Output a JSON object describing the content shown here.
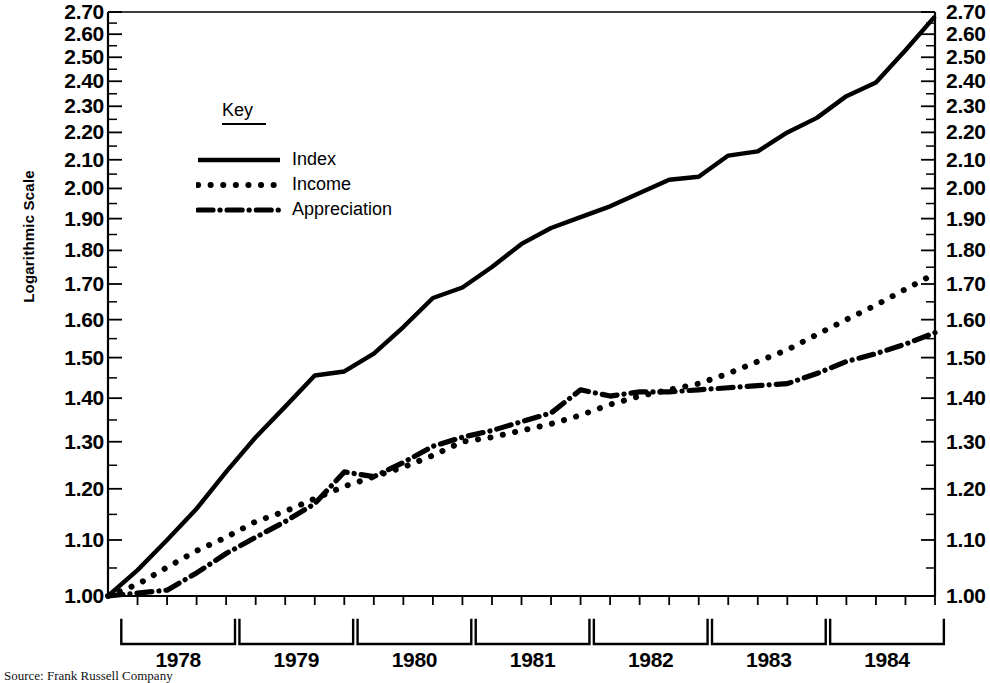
{
  "axis": {
    "y_title": "Logarithmic Scale",
    "y_ticks": [
      "1.00",
      "1.10",
      "1.20",
      "1.30",
      "1.40",
      "1.50",
      "1.60",
      "1.70",
      "1.80",
      "1.90",
      "2.00",
      "2.10",
      "2.20",
      "2.30",
      "2.40",
      "2.50",
      "2.60",
      "2.70"
    ],
    "x_ticks": [
      "1978",
      "1979",
      "1980",
      "1981",
      "1982",
      "1983",
      "1984"
    ]
  },
  "legend": {
    "title": "Key",
    "items": [
      {
        "label": "Index",
        "style": "solid"
      },
      {
        "label": "Income",
        "style": "dotted"
      },
      {
        "label": "Appreciation",
        "style": "dash-dot"
      }
    ]
  },
  "source": {
    "text": "Source: Frank Russell Company"
  },
  "chart_data": {
    "type": "line",
    "title": "",
    "subtitle": "",
    "xlabel": "",
    "ylabel": "Logarithmic Scale",
    "scale": "log",
    "ylim": [
      1.0,
      2.7
    ],
    "y_tick_step": 0.1,
    "y_minor_ticks": true,
    "grid": false,
    "legend_position": "upper-left-inside",
    "x_axis_style": "year-brackets",
    "x": [
      "1977Q4",
      "1978Q1",
      "1978Q2",
      "1978Q3",
      "1978Q4",
      "1979Q1",
      "1979Q2",
      "1979Q3",
      "1979Q4",
      "1980Q1",
      "1980Q2",
      "1980Q3",
      "1980Q4",
      "1981Q1",
      "1981Q2",
      "1981Q3",
      "1981Q4",
      "1982Q1",
      "1982Q2",
      "1982Q3",
      "1982Q4",
      "1983Q1",
      "1983Q2",
      "1983Q3",
      "1983Q4",
      "1984Q1",
      "1984Q2",
      "1984Q3",
      "1984Q4"
    ],
    "series": [
      {
        "name": "Index",
        "style": "solid",
        "values": [
          1.0,
          1.045,
          1.1,
          1.16,
          1.235,
          1.31,
          1.38,
          1.455,
          1.465,
          1.51,
          1.58,
          1.66,
          1.69,
          1.75,
          1.82,
          1.87,
          1.905,
          1.94,
          1.985,
          2.03,
          2.04,
          2.115,
          2.13,
          2.2,
          2.255,
          2.34,
          2.395,
          2.53,
          2.68
        ]
      },
      {
        "name": "Income",
        "style": "dotted",
        "values": [
          1.0,
          1.02,
          1.05,
          1.08,
          1.105,
          1.135,
          1.155,
          1.18,
          1.205,
          1.225,
          1.245,
          1.27,
          1.3,
          1.31,
          1.325,
          1.34,
          1.36,
          1.385,
          1.405,
          1.42,
          1.435,
          1.46,
          1.49,
          1.52,
          1.56,
          1.6,
          1.64,
          1.685,
          1.73
        ]
      },
      {
        "name": "Appreciation",
        "style": "dash-dot",
        "values": [
          1.0,
          1.005,
          1.01,
          1.04,
          1.075,
          1.105,
          1.135,
          1.17,
          1.235,
          1.225,
          1.255,
          1.29,
          1.31,
          1.325,
          1.345,
          1.365,
          1.42,
          1.405,
          1.415,
          1.415,
          1.42,
          1.425,
          1.43,
          1.435,
          1.46,
          1.49,
          1.51,
          1.535,
          1.565
        ]
      }
    ]
  }
}
